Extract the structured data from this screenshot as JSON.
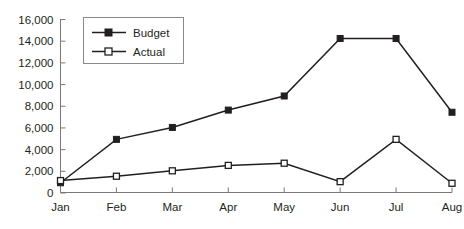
{
  "chart_data": {
    "type": "line",
    "title": "",
    "subtitle": "",
    "xlabel": "",
    "ylabel": "",
    "categories": [
      "Jan",
      "Feb",
      "Mar",
      "Apr",
      "May",
      "Jun",
      "Jul",
      "Aug"
    ],
    "series": [
      {
        "name": "Budget",
        "marker": "filled-square",
        "color": "#231f20",
        "values": [
          900,
          4900,
          6000,
          7600,
          8900,
          14200,
          14200,
          7400
        ]
      },
      {
        "name": "Actual",
        "marker": "open-square",
        "color": "#231f20",
        "values": [
          1100,
          1500,
          2000,
          2500,
          2700,
          1000,
          4900,
          850
        ]
      }
    ],
    "ylim": [
      0,
      16000
    ],
    "ytick_step": 2000,
    "yticks": [
      0,
      2000,
      4000,
      6000,
      8000,
      10000,
      12000,
      14000,
      16000
    ],
    "ytick_labels": [
      "0",
      "2,000",
      "4,000",
      "6,000",
      "8,000",
      "10,000",
      "12,000",
      "14,000",
      "16,000"
    ],
    "grid": false,
    "legend_position": "top-left-inside",
    "legend_entries": [
      "Budget",
      "Actual"
    ],
    "axis_color": "#7a7a7a",
    "line_color": "#231f20",
    "background": "#ffffff"
  },
  "legend": {
    "items": [
      {
        "label": "Budget"
      },
      {
        "label": "Actual"
      }
    ]
  }
}
